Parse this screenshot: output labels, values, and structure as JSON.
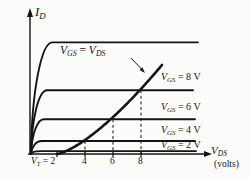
{
  "figure": {
    "ink_color": "#141414",
    "background_color": "#fcfcfa"
  },
  "axes": {
    "y_label": {
      "sym": "I",
      "sub": "D"
    },
    "x_label": {
      "sym": "V",
      "sub": "DS"
    },
    "x_unit": "(volts)",
    "x_tick_first": {
      "sym": "V",
      "sub": "T",
      "rest": " = 2"
    },
    "x_tick_2": "4",
    "x_tick_3": "6",
    "x_tick_4": "8"
  },
  "locus_label": {
    "sym1": "V",
    "sub1": "GS",
    "eq": " = ",
    "sym2": "V",
    "sub2": "DS"
  },
  "chart_data": {
    "type": "line",
    "xlabel": "V_DS (volts)",
    "ylabel": "I_D",
    "x_ticks": [
      2,
      4,
      6,
      8
    ],
    "x_tick_labels": [
      "V_T = 2",
      "4",
      "6",
      "8"
    ],
    "threshold_voltage_VT": 2,
    "dashed_guides_at_x": [
      4,
      6,
      8
    ],
    "grid": false,
    "series": [
      {
        "name": "vgs-top-unlabeled",
        "vgs": null,
        "sat_level": 0.77,
        "end_x_px": 198,
        "label": null
      },
      {
        "name": "vgs-8",
        "vgs": 8,
        "sat_level": 0.44,
        "end_x_px": 193,
        "label": "V_GS = 8 V",
        "label_sym": "V",
        "label_sub": "GS",
        "label_rest": " = 8 V"
      },
      {
        "name": "vgs-6",
        "vgs": 6,
        "sat_level": 0.24,
        "end_x_px": 195,
        "label": "V_GS = 6 V",
        "label_sym": "V",
        "label_sub": "GS",
        "label_rest": " = 6 V"
      },
      {
        "name": "vgs-4",
        "vgs": 4,
        "sat_level": 0.09,
        "end_x_px": 195,
        "label": "V_GS = 4 V",
        "label_sym": "V",
        "label_sub": "GS",
        "label_rest": " = 4 V"
      },
      {
        "name": "vgs-2",
        "vgs": 2,
        "sat_level": 0.02,
        "end_x_px": 196,
        "label": "V_GS = 2 V",
        "label_sym": "V",
        "label_sub": "GS",
        "label_rest": " = 2 V"
      }
    ],
    "locus": {
      "label": "V_GS = V_DS",
      "passes_through": [
        [
          4,
          "vgs-4 knee"
        ],
        [
          6,
          "vgs-6 knee"
        ],
        [
          8,
          "vgs-8 knee"
        ]
      ],
      "starts_at_x": 2
    }
  }
}
